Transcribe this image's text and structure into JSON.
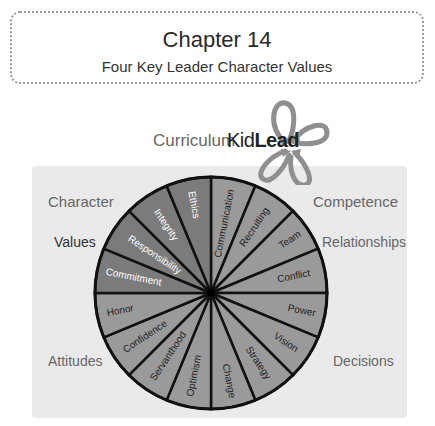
{
  "header": {
    "title": "Chapter 14",
    "subtitle": "Four Key Leader Character Values"
  },
  "branding": {
    "curriculum_label": "Curriculum",
    "logo_kid": "Kid",
    "logo_lead": "Lead",
    "logo_icon": "four-arrow-loop-icon"
  },
  "quadrants": {
    "top_left": {
      "category": "Character",
      "subcategory": "Values"
    },
    "top_right": {
      "category": "Competence",
      "subcategory": "Relationships"
    },
    "bottom_left": {
      "category": "Attitudes"
    },
    "bottom_right": {
      "category": "Decisions"
    }
  },
  "colors": {
    "values_segment": "#7b7b7b",
    "other_segment": "#9a9a9a",
    "outline": "#111111",
    "panel_bg": "#e9e9e9"
  },
  "wheel": {
    "center": [
      211,
      293
    ],
    "radius": 116,
    "segments": [
      {
        "label": "Communication",
        "group": "Relationships"
      },
      {
        "label": "Recruiting",
        "group": "Relationships"
      },
      {
        "label": "Team",
        "group": "Relationships"
      },
      {
        "label": "Conflict",
        "group": "Relationships"
      },
      {
        "label": "Power",
        "group": "Decisions"
      },
      {
        "label": "Vision",
        "group": "Decisions"
      },
      {
        "label": "Strategy",
        "group": "Decisions"
      },
      {
        "label": "Change",
        "group": "Decisions"
      },
      {
        "label": "Optimism",
        "group": "Attitudes"
      },
      {
        "label": "Servanthood",
        "group": "Attitudes"
      },
      {
        "label": "Confidence",
        "group": "Attitudes"
      },
      {
        "label": "Honor",
        "group": "Attitudes"
      },
      {
        "label": "Commitment",
        "group": "Values"
      },
      {
        "label": "Responsibility",
        "group": "Values"
      },
      {
        "label": "Integrity",
        "group": "Values"
      },
      {
        "label": "Ethics",
        "group": "Values"
      }
    ]
  }
}
